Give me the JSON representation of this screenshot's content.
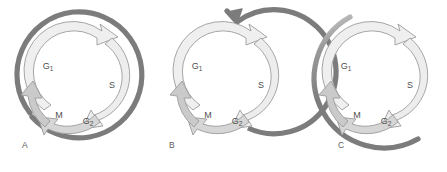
{
  "figure": {
    "background_color": "#ffffff",
    "panel_count": 3
  },
  "colors": {
    "outer_ring": "#7c7c7c",
    "outer_ring_light": "#9a9a9a",
    "inner_arrow_light": "#eeeeee",
    "inner_arrow_mid": "#d8d8d8",
    "inner_arrow_dark": "#c2c2c2",
    "arrow_stroke": "#8d8d8d",
    "label_text": "#4f4f4f",
    "panel_letter": "#5d5d5d"
  },
  "panels": [
    {
      "id": "A",
      "letter": "A",
      "outer_ring": {
        "name": "closed-outer-ring",
        "description": "complete dark gray ring with small gap at lower left",
        "has_arrowhead": false,
        "closed": true
      },
      "phases": [
        {
          "key": "G1",
          "label": "G",
          "sub": "1",
          "x": 48,
          "y": 69
        },
        {
          "key": "S",
          "label": "S",
          "sub": "",
          "x": 112,
          "y": 88
        },
        {
          "key": "M",
          "label": "M",
          "sub": "",
          "x": 59,
          "y": 118
        },
        {
          "key": "G2",
          "label": "G",
          "sub": "2",
          "x": 88,
          "y": 124
        }
      ]
    },
    {
      "id": "B",
      "letter": "B",
      "outer_ring": {
        "name": "spiral-outer-arc",
        "description": "open dark gray arc spiralling outward ending in arrowhead at top",
        "has_arrowhead": true,
        "closed": false
      },
      "phases": [
        {
          "key": "G1",
          "label": "G",
          "sub": "1",
          "x": 48,
          "y": 69
        },
        {
          "key": "S",
          "label": "S",
          "sub": "",
          "x": 112,
          "y": 88
        },
        {
          "key": "M",
          "label": "M",
          "sub": "",
          "x": 59,
          "y": 118
        },
        {
          "key": "G2",
          "label": "G",
          "sub": "2",
          "x": 88,
          "y": 124
        }
      ]
    },
    {
      "id": "C",
      "letter": "C",
      "outer_ring": {
        "name": "partial-outer-arc",
        "description": "open dark gray arc covering left and bottom, fading at upper left",
        "has_arrowhead": false,
        "closed": false
      },
      "phases": [
        {
          "key": "G1",
          "label": "G",
          "sub": "1",
          "x": 48,
          "y": 69
        },
        {
          "key": "S",
          "label": "S",
          "sub": "",
          "x": 112,
          "y": 88
        },
        {
          "key": "M",
          "label": "M",
          "sub": "",
          "x": 59,
          "y": 118
        },
        {
          "key": "G2",
          "label": "G",
          "sub": "2",
          "x": 88,
          "y": 124
        }
      ]
    }
  ],
  "inner_cycle": {
    "name": "cell-cycle-ring",
    "segments": [
      {
        "key": "G1_S",
        "name": "g1-to-s-arrow",
        "shade": "light"
      },
      {
        "key": "S_G2",
        "name": "s-to-g2-arrow",
        "shade": "light"
      },
      {
        "key": "G2_M",
        "name": "g2-to-m-arrow",
        "shade": "mid"
      },
      {
        "key": "M_G1",
        "name": "m-to-g1-arrow",
        "shade": "dark"
      }
    ],
    "direction": "clockwise"
  }
}
